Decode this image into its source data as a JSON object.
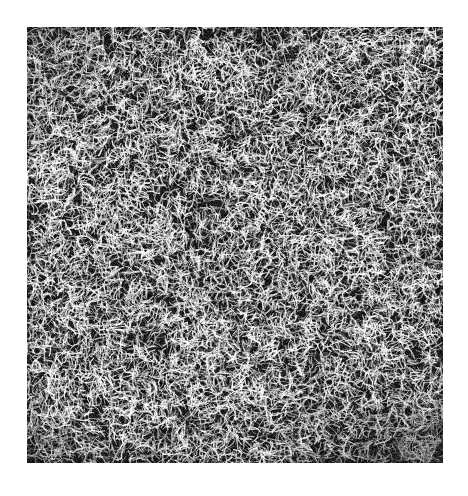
{
  "image": {
    "description": "Grayscale filamentary noise texture (web-like bright filaments on dark background)",
    "colors": {
      "background": "#ffffff",
      "dark": "#1a1a1a",
      "bright": "#f0f0f0"
    },
    "region": {
      "x": 27,
      "y": 27,
      "width": 416,
      "height": 436
    }
  }
}
